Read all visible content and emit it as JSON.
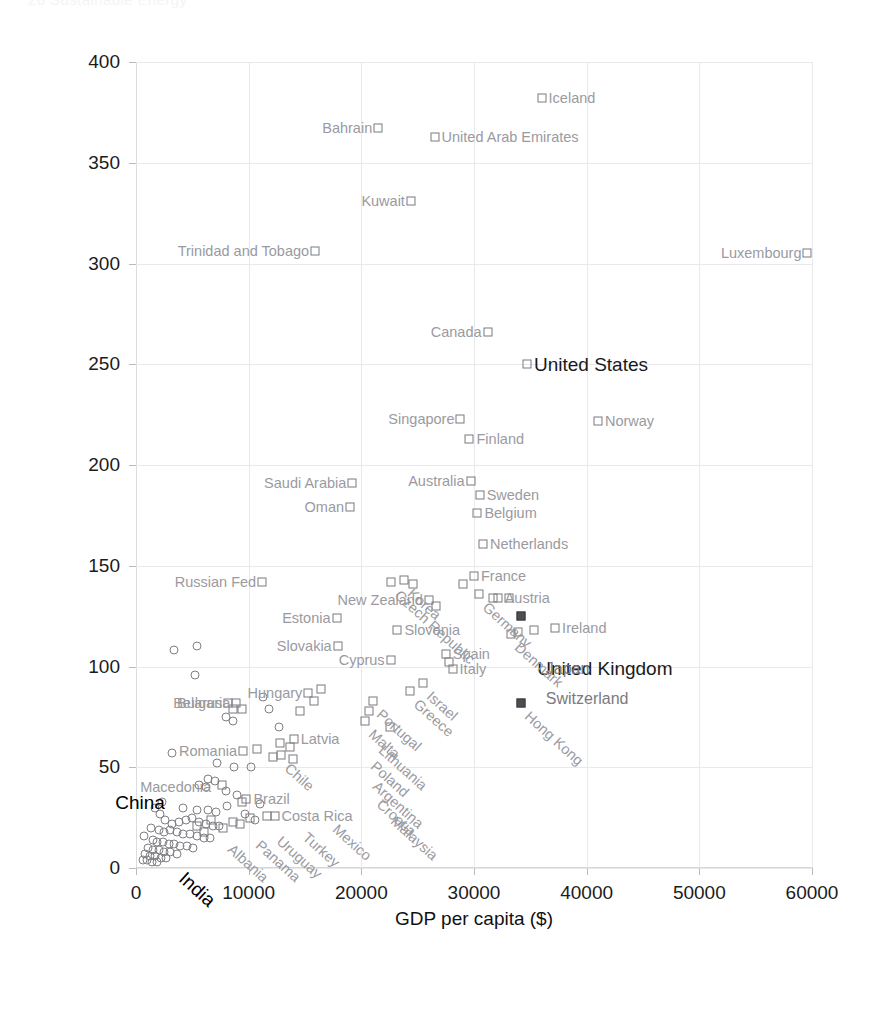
{
  "page": {
    "header_faint": "26      Sustainable Energy"
  },
  "chart_data": {
    "type": "scatter",
    "title": "",
    "xlabel": "GDP per capita ($)",
    "ylabel": "Power consumption (kWh/d/p)",
    "xlim": [
      0,
      60000
    ],
    "ylim": [
      0,
      400
    ],
    "xticks": [
      0,
      10000,
      20000,
      30000,
      40000,
      50000,
      60000
    ],
    "yticks": [
      0,
      50,
      100,
      150,
      200,
      250,
      300,
      350,
      400
    ],
    "grid": true,
    "legend": "none",
    "marker_styles": {
      "square": "OECD / labelled country",
      "circle": "unlabelled country",
      "filled_square": "highlighted country"
    },
    "points": [
      {
        "name": "Iceland",
        "x": 36000,
        "y": 382,
        "marker": "square",
        "label_pos": "right",
        "style": "normal"
      },
      {
        "name": "United Arab Emirates",
        "x": 26500,
        "y": 363,
        "marker": "square",
        "label_pos": "right",
        "style": "normal"
      },
      {
        "name": "Bahrain",
        "x": 21500,
        "y": 367,
        "marker": "square",
        "label_pos": "left",
        "style": "normal"
      },
      {
        "name": "Kuwait",
        "x": 24400,
        "y": 331,
        "marker": "square",
        "label_pos": "left",
        "style": "normal"
      },
      {
        "name": "Trinidad and Tobago",
        "x": 15900,
        "y": 306,
        "marker": "square",
        "label_pos": "left",
        "style": "normal"
      },
      {
        "name": "Luxembourg",
        "x": 59600,
        "y": 305,
        "marker": "square",
        "label_pos": "left",
        "style": "normal"
      },
      {
        "name": "Canada",
        "x": 31200,
        "y": 266,
        "marker": "square",
        "label_pos": "left",
        "style": "normal"
      },
      {
        "name": "United States",
        "x": 34700,
        "y": 250,
        "marker": "square",
        "label_pos": "right",
        "style": "bold"
      },
      {
        "name": "Singapore",
        "x": 28800,
        "y": 223,
        "marker": "square",
        "label_pos": "left",
        "style": "normal"
      },
      {
        "name": "Norway",
        "x": 41000,
        "y": 222,
        "marker": "square",
        "label_pos": "right",
        "style": "normal"
      },
      {
        "name": "Finland",
        "x": 29600,
        "y": 213,
        "marker": "square",
        "label_pos": "right",
        "style": "normal"
      },
      {
        "name": "Australia",
        "x": 29700,
        "y": 192,
        "marker": "square",
        "label_pos": "left",
        "style": "normal"
      },
      {
        "name": "Sweden",
        "x": 30500,
        "y": 185,
        "marker": "square",
        "label_pos": "right",
        "style": "normal"
      },
      {
        "name": "Saudi Arabia",
        "x": 19200,
        "y": 191,
        "marker": "square",
        "label_pos": "left",
        "style": "normal"
      },
      {
        "name": "Belgium",
        "x": 30300,
        "y": 176,
        "marker": "square",
        "label_pos": "right",
        "style": "normal"
      },
      {
        "name": "Oman",
        "x": 19000,
        "y": 179,
        "marker": "square",
        "label_pos": "left",
        "style": "normal"
      },
      {
        "name": "Netherlands",
        "x": 30800,
        "y": 161,
        "marker": "square",
        "label_pos": "right",
        "style": "normal"
      },
      {
        "name": "Korea",
        "x": 23800,
        "y": 143,
        "marker": "square",
        "label_pos": "diag",
        "style": "normal"
      },
      {
        "name": "Czech Republic",
        "x": 22600,
        "y": 142,
        "marker": "square",
        "label_pos": "diag",
        "style": "normal"
      },
      {
        "name": "Germany",
        "x": 30400,
        "y": 136,
        "marker": "square",
        "label_pos": "diag",
        "style": "normal"
      },
      {
        "name": "France",
        "x": 30000,
        "y": 145,
        "marker": "square",
        "label_pos": "right",
        "style": "normal"
      },
      {
        "name": "Russian Fed",
        "x": 11200,
        "y": 142,
        "marker": "square",
        "label_pos": "left",
        "style": "normal"
      },
      {
        "name": "New Zealand",
        "x": 26000,
        "y": 133,
        "marker": "square",
        "label_pos": "left",
        "style": "normal"
      },
      {
        "name": "Austria",
        "x": 32100,
        "y": 134,
        "marker": "square",
        "label_pos": "right",
        "style": "normal"
      },
      {
        "name": "United Kingdom",
        "x": 34200,
        "y": 125,
        "marker": "filled_square",
        "label_pos": "bold_far",
        "style": "bold"
      },
      {
        "name": "Estonia",
        "x": 17800,
        "y": 124,
        "marker": "square",
        "label_pos": "left",
        "style": "normal"
      },
      {
        "name": "Ireland",
        "x": 37200,
        "y": 119,
        "marker": "square",
        "label_pos": "right",
        "style": "normal"
      },
      {
        "name": "Slovenia",
        "x": 23200,
        "y": 118,
        "marker": "square",
        "label_pos": "right",
        "style": "normal"
      },
      {
        "name": "Slovakia",
        "x": 17900,
        "y": 110,
        "marker": "square",
        "label_pos": "left",
        "style": "normal"
      },
      {
        "name": "Spain",
        "x": 27500,
        "y": 106,
        "marker": "square",
        "label_pos": "right",
        "style": "normal"
      },
      {
        "name": "Cyprus",
        "x": 22600,
        "y": 103,
        "marker": "square",
        "label_pos": "left",
        "style": "normal"
      },
      {
        "name": "Italy",
        "x": 28100,
        "y": 99,
        "marker": "square",
        "label_pos": "right",
        "style": "normal"
      },
      {
        "name": "Denmark",
        "x": 33300,
        "y": 116,
        "marker": "square",
        "label_pos": "diag",
        "style": "normal"
      },
      {
        "name": "Japan",
        "x": 38500,
        "y": 99,
        "marker": "none",
        "label_pos": "plain",
        "style": "normal"
      },
      {
        "name": "Israel",
        "x": 25500,
        "y": 92,
        "marker": "square",
        "label_pos": "diag",
        "style": "normal"
      },
      {
        "name": "Greece",
        "x": 24300,
        "y": 88,
        "marker": "square",
        "label_pos": "diag",
        "style": "normal"
      },
      {
        "name": "Switzerland",
        "x": 38500,
        "y": 84,
        "marker": "none",
        "label_pos": "plain",
        "style": "normal"
      },
      {
        "name": "Hong Kong",
        "x": 34200,
        "y": 82,
        "marker": "filled_square",
        "label_pos": "diag",
        "style": "normal"
      },
      {
        "name": "Portugal",
        "x": 21000,
        "y": 83,
        "marker": "square",
        "label_pos": "diag",
        "style": "normal"
      },
      {
        "name": "Hungary",
        "x": 15300,
        "y": 87,
        "marker": "square",
        "label_pos": "left",
        "style": "normal"
      },
      {
        "name": "Belarus",
        "x": 8200,
        "y": 82,
        "marker": "square",
        "label_pos": "left",
        "style": "normal"
      },
      {
        "name": "Bulgaria",
        "x": 8900,
        "y": 82,
        "marker": "square",
        "label_pos": "left",
        "style": "normal"
      },
      {
        "name": "Malta",
        "x": 20300,
        "y": 73,
        "marker": "square",
        "label_pos": "diag",
        "style": "normal"
      },
      {
        "name": "Lithuania",
        "x": 21200,
        "y": 65,
        "marker": "none",
        "label_pos": "diag",
        "style": "normal"
      },
      {
        "name": "Latvia",
        "x": 14000,
        "y": 64,
        "marker": "square",
        "label_pos": "right",
        "style": "normal"
      },
      {
        "name": "Poland",
        "x": 20500,
        "y": 57,
        "marker": "none",
        "label_pos": "diag",
        "style": "normal"
      },
      {
        "name": "Chile",
        "x": 12900,
        "y": 56,
        "marker": "square",
        "label_pos": "diag",
        "style": "normal"
      },
      {
        "name": "Romania",
        "x": 9500,
        "y": 58,
        "marker": "square",
        "label_pos": "left",
        "style": "normal"
      },
      {
        "name": "Argentina",
        "x": 20700,
        "y": 47,
        "marker": "none",
        "label_pos": "diag",
        "style": "normal"
      },
      {
        "name": "Croatia",
        "x": 21000,
        "y": 38,
        "marker": "none",
        "label_pos": "diag",
        "style": "normal"
      },
      {
        "name": "Brazil",
        "x": 9800,
        "y": 34,
        "marker": "square",
        "label_pos": "right",
        "style": "normal"
      },
      {
        "name": "Macedonia",
        "x": 7200,
        "y": 40,
        "marker": "none",
        "label_pos": "left",
        "style": "normal"
      },
      {
        "name": "Costa Rica",
        "x": 12300,
        "y": 26,
        "marker": "square",
        "label_pos": "right",
        "style": "normal"
      },
      {
        "name": "Malaysia",
        "x": 22300,
        "y": 30,
        "marker": "none",
        "label_pos": "diag",
        "style": "normal"
      },
      {
        "name": "Mexico",
        "x": 17100,
        "y": 26,
        "marker": "none",
        "label_pos": "diag",
        "style": "normal"
      },
      {
        "name": "Turkey",
        "x": 14500,
        "y": 22,
        "marker": "none",
        "label_pos": "diag",
        "style": "normal"
      },
      {
        "name": "Uruguay",
        "x": 12200,
        "y": 20,
        "marker": "none",
        "label_pos": "diag",
        "style": "normal"
      },
      {
        "name": "Panama",
        "x": 10300,
        "y": 18,
        "marker": "none",
        "label_pos": "diag",
        "style": "normal"
      },
      {
        "name": "Albania",
        "x": 7800,
        "y": 16,
        "marker": "none",
        "label_pos": "diag",
        "style": "normal"
      },
      {
        "name": "China",
        "x": 4700,
        "y": 33,
        "marker": "none",
        "label_pos": "bold_left",
        "style": "bold"
      },
      {
        "name": "India",
        "x": 5000,
        "y": 5,
        "marker": "none",
        "label_pos": "bold_diag",
        "style": "bold"
      }
    ],
    "unlabelled_squares": [
      {
        "x": 29000,
        "y": 141
      },
      {
        "x": 24600,
        "y": 141
      },
      {
        "x": 31700,
        "y": 134
      },
      {
        "x": 33100,
        "y": 134
      },
      {
        "x": 26600,
        "y": 130
      },
      {
        "x": 33900,
        "y": 117
      },
      {
        "x": 35300,
        "y": 118
      },
      {
        "x": 27800,
        "y": 102
      },
      {
        "x": 20700,
        "y": 78
      },
      {
        "x": 22500,
        "y": 70
      },
      {
        "x": 8600,
        "y": 79
      },
      {
        "x": 9400,
        "y": 79
      },
      {
        "x": 15800,
        "y": 83
      },
      {
        "x": 16400,
        "y": 89
      },
      {
        "x": 14600,
        "y": 78
      },
      {
        "x": 10700,
        "y": 59
      },
      {
        "x": 12800,
        "y": 62
      },
      {
        "x": 13700,
        "y": 60
      },
      {
        "x": 12200,
        "y": 55
      },
      {
        "x": 13900,
        "y": 54
      },
      {
        "x": 7600,
        "y": 41
      },
      {
        "x": 9400,
        "y": 33
      },
      {
        "x": 11600,
        "y": 26
      },
      {
        "x": 10100,
        "y": 25
      },
      {
        "x": 9200,
        "y": 22
      },
      {
        "x": 7700,
        "y": 20
      },
      {
        "x": 8600,
        "y": 23
      },
      {
        "x": 6700,
        "y": 24
      },
      {
        "x": 5400,
        "y": 21
      },
      {
        "x": 6000,
        "y": 18
      }
    ],
    "unlabelled_circles": [
      {
        "x": 3400,
        "y": 108
      },
      {
        "x": 5400,
        "y": 110
      },
      {
        "x": 5200,
        "y": 96
      },
      {
        "x": 8000,
        "y": 75
      },
      {
        "x": 8600,
        "y": 73
      },
      {
        "x": 11300,
        "y": 85
      },
      {
        "x": 11800,
        "y": 79
      },
      {
        "x": 12700,
        "y": 70
      },
      {
        "x": 3200,
        "y": 57
      },
      {
        "x": 7200,
        "y": 52
      },
      {
        "x": 8700,
        "y": 50
      },
      {
        "x": 10200,
        "y": 50
      },
      {
        "x": 6400,
        "y": 44
      },
      {
        "x": 7000,
        "y": 43
      },
      {
        "x": 5600,
        "y": 41
      },
      {
        "x": 6200,
        "y": 40
      },
      {
        "x": 8000,
        "y": 38
      },
      {
        "x": 9000,
        "y": 36
      },
      {
        "x": 11000,
        "y": 32
      },
      {
        "x": 8100,
        "y": 31
      },
      {
        "x": 4200,
        "y": 30
      },
      {
        "x": 5400,
        "y": 29
      },
      {
        "x": 6400,
        "y": 29
      },
      {
        "x": 7100,
        "y": 28
      },
      {
        "x": 9700,
        "y": 27
      },
      {
        "x": 10600,
        "y": 24
      },
      {
        "x": 2600,
        "y": 24
      },
      {
        "x": 3200,
        "y": 22
      },
      {
        "x": 3800,
        "y": 23
      },
      {
        "x": 4400,
        "y": 24
      },
      {
        "x": 5000,
        "y": 25
      },
      {
        "x": 5600,
        "y": 23
      },
      {
        "x": 6200,
        "y": 22
      },
      {
        "x": 6800,
        "y": 21
      },
      {
        "x": 7400,
        "y": 21
      },
      {
        "x": 2000,
        "y": 19
      },
      {
        "x": 2500,
        "y": 18
      },
      {
        "x": 3000,
        "y": 19
      },
      {
        "x": 3600,
        "y": 18
      },
      {
        "x": 4200,
        "y": 17
      },
      {
        "x": 4800,
        "y": 17
      },
      {
        "x": 5400,
        "y": 16
      },
      {
        "x": 6000,
        "y": 15
      },
      {
        "x": 6600,
        "y": 15
      },
      {
        "x": 1500,
        "y": 14
      },
      {
        "x": 1900,
        "y": 13
      },
      {
        "x": 2400,
        "y": 13
      },
      {
        "x": 2900,
        "y": 12
      },
      {
        "x": 3400,
        "y": 12
      },
      {
        "x": 3900,
        "y": 11
      },
      {
        "x": 4500,
        "y": 11
      },
      {
        "x": 5100,
        "y": 10
      },
      {
        "x": 1100,
        "y": 10
      },
      {
        "x": 1500,
        "y": 9
      },
      {
        "x": 2000,
        "y": 9
      },
      {
        "x": 2500,
        "y": 8
      },
      {
        "x": 3000,
        "y": 8
      },
      {
        "x": 3600,
        "y": 7
      },
      {
        "x": 800,
        "y": 7
      },
      {
        "x": 1200,
        "y": 6
      },
      {
        "x": 1700,
        "y": 6
      },
      {
        "x": 2200,
        "y": 5
      },
      {
        "x": 2700,
        "y": 5
      },
      {
        "x": 600,
        "y": 4
      },
      {
        "x": 1000,
        "y": 4
      },
      {
        "x": 1400,
        "y": 3
      },
      {
        "x": 1900,
        "y": 3
      },
      {
        "x": 700,
        "y": 16
      },
      {
        "x": 1300,
        "y": 20
      },
      {
        "x": 2100,
        "y": 27
      },
      {
        "x": 1700,
        "y": 30
      },
      {
        "x": 2300,
        "y": 33
      }
    ]
  }
}
